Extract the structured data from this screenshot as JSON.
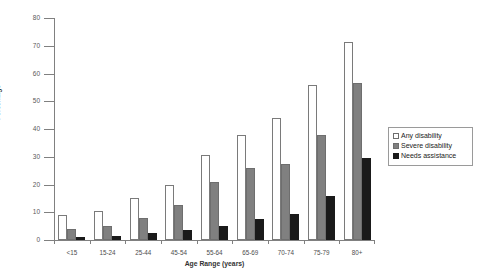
{
  "chart_data": {
    "type": "bar",
    "title": "",
    "xlabel": "Age Range (years)",
    "ylabel": "Percentage",
    "categories": [
      "<15",
      "15-24",
      "25-44",
      "45-54",
      "55-64",
      "65-69",
      "70-74",
      "75-79",
      "80+"
    ],
    "series": [
      {
        "name": "Any disability",
        "color": "#ffffff",
        "values": [
          9,
          10.5,
          15,
          20,
          30.5,
          38,
          44,
          56,
          71.5
        ]
      },
      {
        "name": "Severe disability",
        "color": "#808080",
        "values": [
          4,
          5,
          8,
          12.5,
          21,
          26,
          27.5,
          38,
          56.5
        ]
      },
      {
        "name": "Needs assistance",
        "color": "#1a1a1a",
        "values": [
          1,
          1.5,
          2.5,
          3.5,
          5,
          7.5,
          9.5,
          16,
          29.5
        ]
      }
    ],
    "ylim": [
      0,
      80
    ],
    "yticks": [
      0,
      10,
      20,
      30,
      40,
      50,
      60,
      70,
      80
    ],
    "ytick_labels": [
      "0",
      "10",
      "20",
      "30",
      "40",
      "50",
      "60",
      "70",
      "80"
    ],
    "grid": false,
    "legend_position": "right-inside",
    "legend_entries": [
      "Any disability",
      "Severe disability",
      "Needs assistance"
    ]
  }
}
